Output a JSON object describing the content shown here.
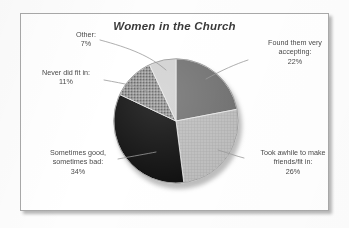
{
  "frame": {
    "border_color": "#a9a9a9",
    "background": "#ffffff"
  },
  "chart_data": {
    "type": "pie",
    "title": "Women in the Church",
    "xlabel": "",
    "ylabel": "",
    "legend_position": "callout-labels",
    "grid": false,
    "start_angle_deg": 0,
    "direction": "clockwise",
    "categories": [
      "Found them very accepting",
      "Took awhile to make friends/fit in",
      "Sometimes good, sometimes bad",
      "Never did fit in",
      "Other"
    ],
    "values": [
      22,
      26,
      34,
      11,
      7
    ],
    "units": "percent",
    "total": 100,
    "colors": [
      "#6e6e6e",
      "#b8b8b8",
      "#0d0d0d",
      "#858585",
      "#d0d0d0"
    ],
    "slices": [
      {
        "label": "Found them very accepting",
        "value": 22,
        "value_text": "22%",
        "color": "#6e6e6e",
        "fill_style": "solid-dark-gray",
        "start_deg": 0.0,
        "end_deg": 79.2
      },
      {
        "label": "Took awhile to make friends/fit in",
        "value": 26,
        "value_text": "26%",
        "color": "#b8b8b8",
        "fill_style": "crosshatch-light-gray",
        "start_deg": 79.2,
        "end_deg": 172.8
      },
      {
        "label": "Sometimes good, sometimes bad",
        "value": 34,
        "value_text": "34%",
        "color": "#0d0d0d",
        "fill_style": "solid-black",
        "start_deg": 172.8,
        "end_deg": 295.2
      },
      {
        "label": "Never did fit in",
        "value": 11,
        "value_text": "11%",
        "color": "#858585",
        "fill_style": "speckled-gray",
        "start_deg": 295.2,
        "end_deg": 334.8
      },
      {
        "label": "Other",
        "value": 7,
        "value_text": "7%",
        "color": "#d0d0d0",
        "fill_style": "solid-very-light-gray",
        "start_deg": 334.8,
        "end_deg": 360.0
      }
    ]
  },
  "labels": {
    "other": {
      "line1": "Other:",
      "line2": "7%"
    },
    "never": {
      "line1": "Never did fit in:",
      "line2": "11%"
    },
    "sometimes": {
      "line1": "Sometimes good,",
      "line2": "sometimes bad:",
      "line3": "34%"
    },
    "took": {
      "line1": "Took awhile to make",
      "line2": "friends/fit in:",
      "line3": "26%"
    },
    "found": {
      "line1": "Found them very",
      "line2": "accepting:",
      "line3": "22%"
    }
  }
}
